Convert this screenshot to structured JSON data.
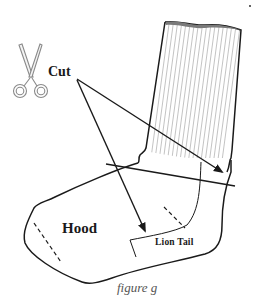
{
  "figure": {
    "caption": "figure g",
    "labels": {
      "cut": "Cut",
      "hood": "Hood",
      "lion_tail": "Lion Tail"
    },
    "icons": {
      "scissors": "scissors-icon"
    },
    "colors": {
      "line": "#1a1a1a",
      "rib_lines": "#9a9a9a",
      "scissors_outline": "#8a8a8a",
      "caption": "#555555",
      "background": "#ffffff"
    }
  }
}
